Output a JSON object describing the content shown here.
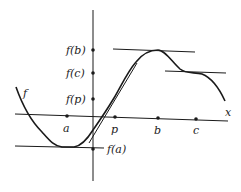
{
  "diagram": {
    "type": "function-graph",
    "curve_label": "f",
    "x_axis_label": "x",
    "x_points": [
      {
        "label": "a",
        "x": 67,
        "y": 116,
        "lx": 63,
        "ly": 132
      },
      {
        "label": "p",
        "x": 115,
        "y": 117,
        "lx": 111,
        "ly": 133
      },
      {
        "label": "b",
        "x": 158,
        "y": 118,
        "lx": 154,
        "ly": 134
      },
      {
        "label": "c",
        "x": 196,
        "y": 119,
        "lx": 193,
        "ly": 134
      }
    ],
    "y_points": [
      {
        "label": "f(b)",
        "y": 50
      },
      {
        "label": "f(c)",
        "y": 73
      },
      {
        "label": "f(p)",
        "y": 99
      },
      {
        "label": "f(a)",
        "y": 149
      }
    ],
    "tangent_lines": [
      {
        "name": "tangent-at-a",
        "x1": 15,
        "y1": 146,
        "x2": 104,
        "y2": 148
      },
      {
        "name": "tangent-at-b",
        "x1": 113,
        "y1": 49,
        "x2": 195,
        "y2": 52
      },
      {
        "name": "tangent-at-c",
        "x1": 165,
        "y1": 71,
        "x2": 226,
        "y2": 73
      },
      {
        "name": "tangent-at-p",
        "x1": 89,
        "y1": 143,
        "x2": 137,
        "y2": 63
      }
    ],
    "colors": {
      "ink": "#1a1a1a",
      "background": "#ffffff"
    }
  }
}
